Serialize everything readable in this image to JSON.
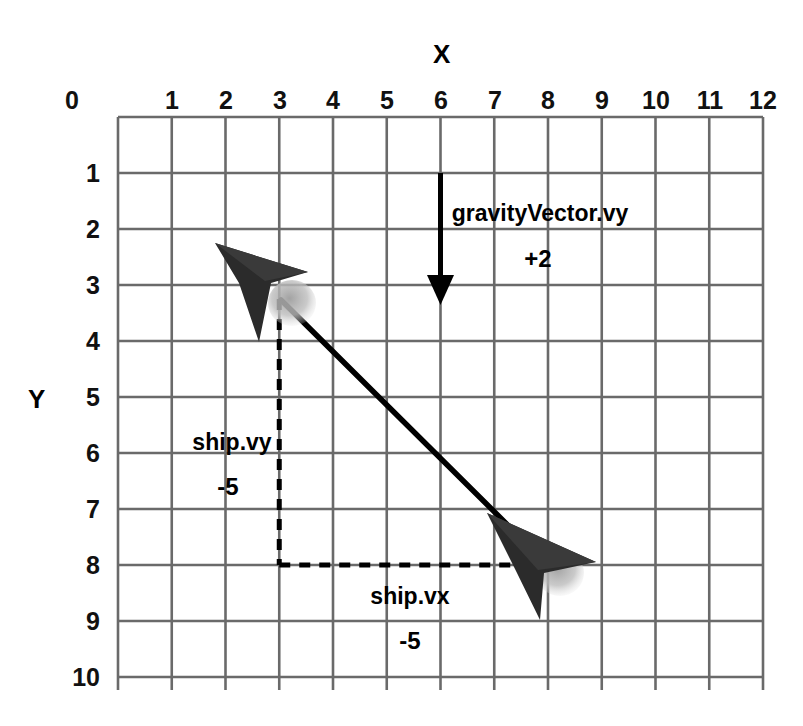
{
  "figure": {
    "type": "vector-diagram",
    "background_color": "#ffffff",
    "grid_color": "#6a6a6a",
    "ink_color": "#000000",
    "shadow_color": "#b9b9b9"
  },
  "axes": {
    "x_title": "X",
    "y_title": "Y",
    "x_ticks": [
      "0",
      "1",
      "2",
      "3",
      "4",
      "5",
      "6",
      "7",
      "8",
      "9",
      "10",
      "11",
      "12"
    ],
    "y_ticks": [
      "1",
      "2",
      "3",
      "4",
      "5",
      "6",
      "7",
      "8",
      "9",
      "10"
    ],
    "x_range": [
      0,
      12
    ],
    "y_range": [
      0,
      10
    ],
    "grid": true
  },
  "annotations": [
    {
      "name": "gravity-vector-label",
      "text": "gravityVector.vy",
      "value": "+2",
      "x": 7.85,
      "y": 1.72
    },
    {
      "name": "ship-vy-label",
      "text": "ship.vy",
      "value": "-5",
      "x": 2.12,
      "y": 5.72
    },
    {
      "name": "ship-vx-label",
      "text": "ship.vx",
      "value": "-5",
      "x": 5.45,
      "y": 8.47
    }
  ],
  "vectors": {
    "gravity": {
      "label": "gravityVector.vy",
      "from": [
        6,
        1
      ],
      "to": [
        6,
        3.28
      ],
      "style": "solid-arrow"
    },
    "velocity": {
      "label": "ship velocity",
      "from": [
        8,
        8
      ],
      "to": [
        3,
        3.25
      ],
      "style": "solid-line"
    },
    "vy_component": {
      "label": "ship.vy",
      "from": [
        3,
        8
      ],
      "to": [
        3,
        3.25
      ],
      "style": "dashed"
    },
    "vx_component": {
      "label": "ship.vx",
      "from": [
        3,
        8
      ],
      "to": [
        8,
        8
      ],
      "style": "dashed"
    }
  },
  "ships": [
    {
      "name": "ship-new-position",
      "x": 3,
      "y": 3.2
    },
    {
      "name": "ship-old-position",
      "x": 8,
      "y": 8
    }
  ]
}
